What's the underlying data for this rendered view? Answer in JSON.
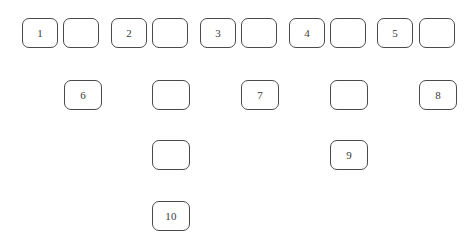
{
  "figure": {
    "title": "",
    "background_color": "#ffffff",
    "box_border_color": "#4a4a4a",
    "box_fill_color": "#ffffff",
    "label_color": "#3a3a3a"
  },
  "rows": [
    {
      "name": "row-1",
      "top": 18,
      "cells": [
        {
          "label": "1",
          "left": 22,
          "width": 36,
          "height": 30,
          "empty": false
        },
        {
          "label": "",
          "left": 63,
          "width": 36,
          "height": 30,
          "empty": true
        },
        {
          "label": "2",
          "left": 111,
          "width": 36,
          "height": 30,
          "empty": false
        },
        {
          "label": "",
          "left": 152,
          "width": 36,
          "height": 30,
          "empty": true
        },
        {
          "label": "3",
          "left": 200,
          "width": 36,
          "height": 30,
          "empty": false
        },
        {
          "label": "",
          "left": 241,
          "width": 36,
          "height": 30,
          "empty": true
        },
        {
          "label": "4",
          "left": 289,
          "width": 36,
          "height": 30,
          "empty": false
        },
        {
          "label": "",
          "left": 330,
          "width": 36,
          "height": 30,
          "empty": true
        },
        {
          "label": "5",
          "left": 377,
          "width": 36,
          "height": 30,
          "empty": false
        },
        {
          "label": "",
          "left": 419,
          "width": 36,
          "height": 30,
          "empty": true
        }
      ]
    },
    {
      "name": "row-2",
      "top": 80,
      "cells": [
        {
          "label": "6",
          "left": 64,
          "width": 38,
          "height": 30,
          "empty": false
        },
        {
          "label": "",
          "left": 152,
          "width": 38,
          "height": 30,
          "empty": true
        },
        {
          "label": "7",
          "left": 241,
          "width": 38,
          "height": 30,
          "empty": false
        },
        {
          "label": "",
          "left": 330,
          "width": 38,
          "height": 30,
          "empty": true
        },
        {
          "label": "8",
          "left": 419,
          "width": 38,
          "height": 30,
          "empty": false
        }
      ]
    },
    {
      "name": "row-3",
      "top": 140,
      "cells": [
        {
          "label": "",
          "left": 152,
          "width": 38,
          "height": 30,
          "empty": true
        },
        {
          "label": "9",
          "left": 330,
          "width": 38,
          "height": 30,
          "empty": false
        }
      ]
    },
    {
      "name": "row-4",
      "top": 201,
      "cells": [
        {
          "label": "10",
          "left": 152,
          "width": 38,
          "height": 30,
          "empty": false
        }
      ]
    }
  ]
}
